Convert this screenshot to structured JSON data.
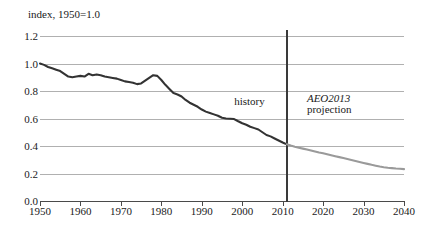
{
  "chart_data": {
    "type": "line",
    "title": "",
    "ylabel": "index, 1950=1.0",
    "xlabel": "",
    "ylim": [
      0.0,
      1.2
    ],
    "xlim": [
      1950,
      2040
    ],
    "grid": true,
    "legend": "none",
    "y_ticks": [
      "1.2",
      "1.0",
      "0.8",
      "0.6",
      "0.4",
      "0.2",
      "0.0"
    ],
    "y_tick_values": [
      1.2,
      1.0,
      0.8,
      0.6,
      0.4,
      0.2,
      0.0
    ],
    "x_ticks": [
      "1950",
      "1960",
      "1970",
      "1980",
      "1990",
      "2000",
      "2010",
      "2020",
      "2030",
      "2040"
    ],
    "x_tick_values": [
      1950,
      1960,
      1970,
      1980,
      1990,
      2000,
      2010,
      2020,
      2030,
      2040
    ],
    "annotations": [
      {
        "id": "history",
        "text": "history",
        "x": 1998,
        "y": 0.72,
        "style": "regular"
      },
      {
        "id": "projection-line1",
        "text": "AEO2013",
        "x": 2016,
        "y": 0.74,
        "style": "italic"
      },
      {
        "id": "projection-line2",
        "text": "projection",
        "x": 2016,
        "y": 0.66,
        "style": "regular"
      }
    ],
    "divider_year": 2011,
    "series": [
      {
        "name": "history",
        "color": "#333333",
        "x": [
          1950,
          1951,
          1952,
          1953,
          1954,
          1955,
          1956,
          1957,
          1958,
          1959,
          1960,
          1961,
          1962,
          1963,
          1964,
          1965,
          1966,
          1967,
          1968,
          1969,
          1970,
          1971,
          1972,
          1973,
          1974,
          1975,
          1976,
          1977,
          1978,
          1979,
          1980,
          1981,
          1982,
          1983,
          1984,
          1985,
          1986,
          1987,
          1988,
          1989,
          1990,
          1991,
          1992,
          1993,
          1994,
          1995,
          1996,
          1997,
          1998,
          1999,
          2000,
          2001,
          2002,
          2003,
          2004,
          2005,
          2006,
          2007,
          2008,
          2009,
          2010,
          2011
        ],
        "values": [
          1.0,
          0.99,
          0.975,
          0.965,
          0.955,
          0.945,
          0.925,
          0.905,
          0.9,
          0.905,
          0.91,
          0.905,
          0.925,
          0.915,
          0.92,
          0.915,
          0.905,
          0.9,
          0.895,
          0.89,
          0.88,
          0.87,
          0.865,
          0.86,
          0.85,
          0.855,
          0.875,
          0.895,
          0.915,
          0.91,
          0.88,
          0.845,
          0.815,
          0.785,
          0.775,
          0.76,
          0.735,
          0.715,
          0.7,
          0.685,
          0.665,
          0.65,
          0.64,
          0.63,
          0.62,
          0.605,
          0.6,
          0.598,
          0.596,
          0.58,
          0.565,
          0.555,
          0.54,
          0.53,
          0.52,
          0.5,
          0.48,
          0.47,
          0.455,
          0.44,
          0.425,
          0.412
        ]
      },
      {
        "name": "AEO2013 projection",
        "color": "#9a9a9a",
        "x": [
          2011,
          2012,
          2013,
          2014,
          2015,
          2016,
          2017,
          2018,
          2019,
          2020,
          2021,
          2022,
          2023,
          2024,
          2025,
          2026,
          2027,
          2028,
          2029,
          2030,
          2031,
          2032,
          2033,
          2034,
          2035,
          2036,
          2037,
          2038,
          2039,
          2040
        ],
        "values": [
          0.412,
          0.403,
          0.395,
          0.388,
          0.381,
          0.374,
          0.367,
          0.36,
          0.353,
          0.347,
          0.34,
          0.333,
          0.326,
          0.319,
          0.312,
          0.305,
          0.298,
          0.291,
          0.284,
          0.277,
          0.27,
          0.263,
          0.257,
          0.251,
          0.246,
          0.242,
          0.239,
          0.236,
          0.234,
          0.232
        ]
      }
    ]
  }
}
